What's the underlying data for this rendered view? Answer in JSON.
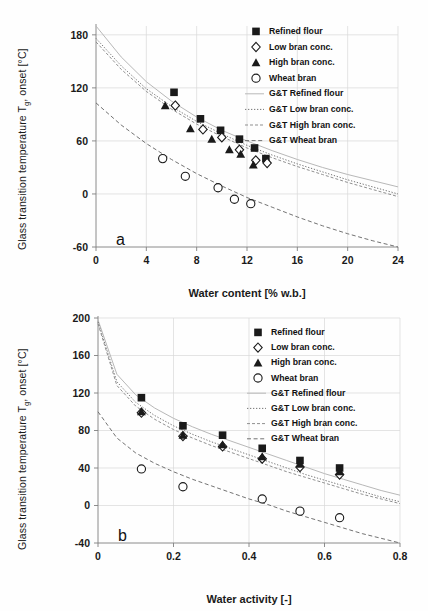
{
  "figure": {
    "panels": [
      {
        "letter": "a",
        "xlabel": "Water content [% w.b.]",
        "ylabel_line1": "Glass transition temperature",
        "ylabel_line2": "T",
        "ylabel_sub": "g",
        "ylabel_line3": ", onset [°C]"
      },
      {
        "letter": "b",
        "xlabel": "Water activity [-]",
        "ylabel_line1": "Glass transition temperature",
        "ylabel_line2": "T",
        "ylabel_sub": "g",
        "ylabel_line3": ", onset [°C]"
      }
    ],
    "legend_labels": [
      "Refined flour",
      "Low bran conc.",
      "High bran conc.",
      "Wheat bran",
      "G&T Refined flour",
      "G&T Low bran conc.",
      "G&T High bran conc.",
      "G&T Wheat bran"
    ],
    "colors": {
      "marker": "#1a1a1a",
      "grid": "#d9d9d9",
      "axis": "#808080",
      "curve": "#555555",
      "background": "#ffffff"
    }
  },
  "chart_data": [
    {
      "type": "scatter",
      "panel": "a",
      "title": "",
      "xlabel": "Water content [% w.b.]",
      "ylabel": "Glass transition temperature Tg, onset [°C]",
      "xlim": [
        0,
        24
      ],
      "ylim": [
        -60,
        190
      ],
      "xticks": [
        0,
        4,
        8,
        12,
        16,
        20,
        24
      ],
      "yticks": [
        -60,
        0,
        60,
        120,
        180
      ],
      "grid": true,
      "legend_position": "top-right-outside",
      "series": [
        {
          "name": "Refined flour",
          "marker": "filled-square",
          "points": [
            [
              6.2,
              115
            ],
            [
              8.3,
              85
            ],
            [
              9.9,
              72
            ],
            [
              11.4,
              62
            ],
            [
              12.6,
              52
            ],
            [
              13.5,
              40
            ]
          ]
        },
        {
          "name": "Low bran conc.",
          "marker": "open-diamond",
          "points": [
            [
              6.3,
              100
            ],
            [
              8.5,
              73
            ],
            [
              10.0,
              64
            ],
            [
              11.4,
              50
            ],
            [
              12.7,
              38
            ],
            [
              13.6,
              35
            ]
          ]
        },
        {
          "name": "High bran conc.",
          "marker": "filled-triangle",
          "points": [
            [
              5.5,
              100
            ],
            [
              7.5,
              74
            ],
            [
              9.2,
              62
            ],
            [
              10.6,
              50
            ],
            [
              11.5,
              45
            ],
            [
              12.5,
              33
            ]
          ]
        },
        {
          "name": "Wheat bran",
          "marker": "open-circle",
          "points": [
            [
              5.3,
              40
            ],
            [
              7.1,
              20
            ],
            [
              9.7,
              7
            ],
            [
              11.0,
              -6
            ],
            [
              12.3,
              -11
            ]
          ]
        },
        {
          "name": "G&T Refined flour",
          "line": "solid-light",
          "points": [
            [
              0,
              190
            ],
            [
              2,
              155
            ],
            [
              4,
              127
            ],
            [
              6,
              105
            ],
            [
              8,
              87
            ],
            [
              10,
              72
            ],
            [
              12,
              60
            ],
            [
              14,
              49
            ],
            [
              16,
              39
            ],
            [
              18,
              30
            ],
            [
              20,
              22
            ],
            [
              22,
              15
            ],
            [
              24,
              8
            ]
          ]
        },
        {
          "name": "G&T Low bran conc.",
          "line": "dotted",
          "points": [
            [
              0,
              176
            ],
            [
              2,
              145
            ],
            [
              4,
              119
            ],
            [
              6,
              99
            ],
            [
              8,
              82
            ],
            [
              10,
              68
            ],
            [
              12,
              55
            ],
            [
              14,
              44
            ],
            [
              16,
              34
            ],
            [
              18,
              25
            ],
            [
              20,
              16
            ],
            [
              22,
              8
            ],
            [
              24,
              0
            ]
          ]
        },
        {
          "name": "G&T High bran conc.",
          "line": "dashed-fine",
          "points": [
            [
              0,
              172
            ],
            [
              2,
              141
            ],
            [
              4,
              116
            ],
            [
              6,
              96
            ],
            [
              8,
              79
            ],
            [
              10,
              65
            ],
            [
              12,
              52
            ],
            [
              14,
              41
            ],
            [
              16,
              31
            ],
            [
              18,
              22
            ],
            [
              20,
              13
            ],
            [
              22,
              5
            ],
            [
              24,
              -3
            ]
          ]
        },
        {
          "name": "G&T Wheat bran",
          "line": "dashed",
          "points": [
            [
              0,
              103
            ],
            [
              2,
              78
            ],
            [
              4,
              57
            ],
            [
              6,
              39
            ],
            [
              8,
              23
            ],
            [
              10,
              9
            ],
            [
              12,
              -4
            ],
            [
              14,
              -15
            ],
            [
              16,
              -26
            ],
            [
              18,
              -36
            ],
            [
              20,
              -45
            ],
            [
              22,
              -53
            ],
            [
              24,
              -60
            ]
          ]
        }
      ]
    },
    {
      "type": "scatter",
      "panel": "b",
      "title": "",
      "xlabel": "Water activity [-]",
      "ylabel": "Glass transition temperature Tg, onset [°C]",
      "xlim": [
        0,
        0.8
      ],
      "ylim": [
        -40,
        200
      ],
      "xticks": [
        0,
        0.2,
        0.4,
        0.6,
        0.8
      ],
      "yticks": [
        -40,
        0,
        40,
        80,
        120,
        160,
        200
      ],
      "grid": true,
      "legend_position": "top-right-outside",
      "series": [
        {
          "name": "Refined flour",
          "marker": "filled-square",
          "points": [
            [
              0.115,
              115
            ],
            [
              0.225,
              85
            ],
            [
              0.33,
              75
            ],
            [
              0.435,
              61
            ],
            [
              0.535,
              48
            ],
            [
              0.64,
              40
            ]
          ]
        },
        {
          "name": "Low bran conc.",
          "marker": "open-diamond",
          "points": [
            [
              0.115,
              99
            ],
            [
              0.225,
              74
            ],
            [
              0.33,
              63
            ],
            [
              0.435,
              50
            ],
            [
              0.535,
              41
            ],
            [
              0.64,
              33
            ]
          ]
        },
        {
          "name": "High bran conc.",
          "marker": "filled-triangle",
          "points": [
            [
              0.115,
              100
            ],
            [
              0.225,
              75
            ],
            [
              0.33,
              65
            ],
            [
              0.435,
              52
            ],
            [
              0.535,
              44
            ],
            [
              0.64,
              36
            ]
          ]
        },
        {
          "name": "Wheat bran",
          "marker": "open-circle",
          "points": [
            [
              0.115,
              39
            ],
            [
              0.225,
              20
            ],
            [
              0.435,
              7
            ],
            [
              0.535,
              -6
            ],
            [
              0.64,
              -13
            ]
          ]
        },
        {
          "name": "G&T Refined flour",
          "line": "solid-light",
          "points": [
            [
              0.0,
              198
            ],
            [
              0.05,
              140
            ],
            [
              0.1,
              118
            ],
            [
              0.15,
              104
            ],
            [
              0.2,
              93
            ],
            [
              0.25,
              84
            ],
            [
              0.3,
              76
            ],
            [
              0.35,
              69
            ],
            [
              0.4,
              62
            ],
            [
              0.45,
              55
            ],
            [
              0.5,
              48
            ],
            [
              0.55,
              41
            ],
            [
              0.6,
              34
            ],
            [
              0.65,
              28
            ],
            [
              0.7,
              22
            ],
            [
              0.75,
              16
            ],
            [
              0.8,
              11
            ]
          ]
        },
        {
          "name": "G&T Low bran conc.",
          "line": "dotted",
          "points": [
            [
              0.0,
              196
            ],
            [
              0.05,
              132
            ],
            [
              0.1,
              110
            ],
            [
              0.15,
              96
            ],
            [
              0.2,
              85
            ],
            [
              0.25,
              76
            ],
            [
              0.3,
              68
            ],
            [
              0.35,
              61
            ],
            [
              0.4,
              54
            ],
            [
              0.45,
              47
            ],
            [
              0.5,
              40
            ],
            [
              0.55,
              33
            ],
            [
              0.6,
              27
            ],
            [
              0.65,
              21
            ],
            [
              0.7,
              15
            ],
            [
              0.75,
              9
            ],
            [
              0.8,
              4
            ]
          ]
        },
        {
          "name": "G&T High bran conc.",
          "line": "dashed-fine",
          "points": [
            [
              0.0,
              194
            ],
            [
              0.05,
              128
            ],
            [
              0.1,
              106
            ],
            [
              0.15,
              92
            ],
            [
              0.2,
              81
            ],
            [
              0.25,
              72
            ],
            [
              0.3,
              64
            ],
            [
              0.35,
              57
            ],
            [
              0.4,
              50
            ],
            [
              0.45,
              43
            ],
            [
              0.5,
              36
            ],
            [
              0.55,
              30
            ],
            [
              0.6,
              24
            ],
            [
              0.65,
              18
            ],
            [
              0.7,
              12
            ],
            [
              0.75,
              7
            ],
            [
              0.8,
              2
            ]
          ]
        },
        {
          "name": "G&T Wheat bran",
          "line": "dashed",
          "points": [
            [
              0.0,
              100
            ],
            [
              0.05,
              72
            ],
            [
              0.1,
              56
            ],
            [
              0.15,
              45
            ],
            [
              0.2,
              36
            ],
            [
              0.25,
              28
            ],
            [
              0.3,
              21
            ],
            [
              0.35,
              14
            ],
            [
              0.4,
              7
            ],
            [
              0.45,
              1
            ],
            [
              0.5,
              -6
            ],
            [
              0.55,
              -12
            ],
            [
              0.6,
              -18
            ],
            [
              0.65,
              -24
            ],
            [
              0.7,
              -30
            ],
            [
              0.75,
              -35
            ],
            [
              0.8,
              -40
            ]
          ]
        }
      ]
    }
  ]
}
